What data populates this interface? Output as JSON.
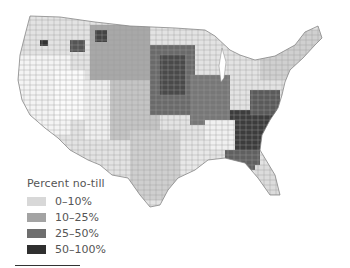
{
  "map": {
    "title": "Percent no-till",
    "region": "Contiguous United States (by county)",
    "legend": {
      "title": "Percent no-till",
      "items": [
        {
          "label": "0–10%",
          "color": "#d8d8d8"
        },
        {
          "label": "10–25%",
          "color": "#a3a3a3"
        },
        {
          "label": "25–50%",
          "color": "#6e6e6e"
        },
        {
          "label": "50–100%",
          "color": "#2f2f2f"
        }
      ]
    }
  }
}
